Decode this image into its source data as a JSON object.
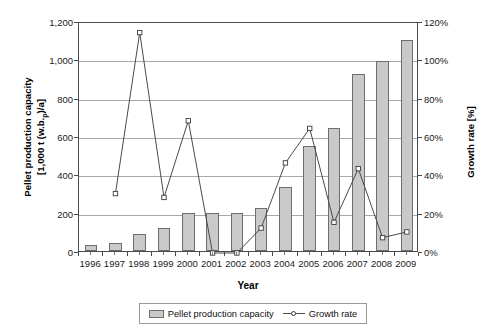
{
  "chart_data": {
    "type": "bar",
    "title": "",
    "xlabel": "Year",
    "ylabel": "Pellet production capacity [1,000 t (w.b.)/a]",
    "ylabel_right": "Growth rate [%]",
    "categories": [
      "1996",
      "1997",
      "1998",
      "1999",
      "2000",
      "2001",
      "2002",
      "2003",
      "2004",
      "2005",
      "2006",
      "2007",
      "2008",
      "2009"
    ],
    "ylim": [
      0,
      1200
    ],
    "ylim_right": [
      0,
      120
    ],
    "grid": true,
    "legend_position": "bottom",
    "series": [
      {
        "name": "Pellet production capacity",
        "type": "bar",
        "axis": "left",
        "unit": "1,000 t (w.b.)/a",
        "values": [
          30,
          42,
          90,
          120,
          200,
          200,
          200,
          225,
          335,
          550,
          640,
          925,
          990,
          1100
        ]
      },
      {
        "name": "Growth rate",
        "type": "line",
        "axis": "right",
        "unit": "%",
        "values": [
          null,
          31,
          115,
          29,
          69,
          0,
          0,
          13,
          47,
          65,
          16,
          44,
          8,
          11
        ]
      }
    ],
    "yticks_left": [
      "0",
      "200",
      "400",
      "600",
      "800",
      "1,000",
      "1,200"
    ],
    "yticks_left_values": [
      0,
      200,
      400,
      600,
      800,
      1000,
      1200
    ],
    "yticks_right": [
      "0%",
      "20%",
      "40%",
      "60%",
      "80%",
      "100%",
      "120%"
    ],
    "yticks_right_values": [
      0,
      20,
      40,
      60,
      80,
      100,
      120
    ]
  },
  "axes": {
    "y_left_title_line1": "Pellet production capacity",
    "y_left_title_line2_pre": "[1,000 t (w.b.",
    "y_left_title_line2_sub": "p",
    "y_left_title_line2_post": ")/a]",
    "y_right_title": "Growth rate [%]",
    "x_title": "Year"
  },
  "legend": {
    "bar_label": "Pellet production capacity",
    "line_label": "Growth rate"
  },
  "colors": {
    "bar_fill": "#c9c9c9",
    "bar_stroke": "#6e6e6e",
    "line_stroke": "#4a4a4a",
    "marker_fill": "#ffffff",
    "marker_stroke": "#3c3c3c",
    "grid": "#a9a9a9",
    "axis": "#4a4a4a",
    "background": "#ffffff"
  }
}
